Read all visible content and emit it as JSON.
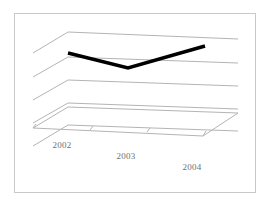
{
  "figure": {
    "background_color": "#ffffff",
    "border_color": "#c9c9c9",
    "gridline_color": "#b4b4b4",
    "floor_color": "#b4b4b4",
    "series_color": "#000000",
    "label_color": "#6f6f6f"
  },
  "chart_data": {
    "type": "line",
    "title": "",
    "subtitle": "",
    "xlabel": "",
    "ylabel": "",
    "categories": [
      "2002",
      "2003",
      "2004"
    ],
    "series": [
      {
        "name": "",
        "values": [
          2.0,
          1.4,
          2.35
        ]
      }
    ],
    "x": [
      "2002",
      "2003",
      "2004"
    ],
    "ylim": [
      0,
      4
    ],
    "yticks": [
      0,
      1,
      2,
      3,
      4
    ],
    "ytick_labels": [
      "",
      "",
      "",
      "",
      ""
    ],
    "grid": true,
    "legend": false,
    "legend_position": "none",
    "projection": "3d",
    "annotations": []
  },
  "axis": {
    "x_tick_labels": [
      {
        "text": "2002",
        "x": 62,
        "y": 148
      },
      {
        "text": "2003",
        "x": 126,
        "y": 159
      },
      {
        "text": "2004",
        "x": 192,
        "y": 170
      }
    ]
  },
  "geometry": {
    "border": {
      "x": 14.5,
      "y": 13.5,
      "width": 241,
      "height": 179
    },
    "gridlines": [
      {
        "name": "gridline-top",
        "left_x": 33,
        "left_y": 53,
        "bend_x": 68,
        "bend_y": 32,
        "right_x": 238,
        "right_y": 39
      },
      {
        "name": "gridline-2",
        "left_x": 33,
        "left_y": 77,
        "bend_x": 68,
        "bend_y": 57,
        "right_x": 238,
        "right_y": 63
      },
      {
        "name": "gridline-3",
        "left_x": 33,
        "left_y": 100,
        "bend_x": 68,
        "bend_y": 80,
        "right_x": 238,
        "right_y": 86
      },
      {
        "name": "gridline-4",
        "left_x": 33,
        "left_y": 123,
        "bend_x": 68,
        "bend_y": 103,
        "right_x": 238,
        "right_y": 109
      },
      {
        "name": "gridline-base",
        "left_x": 33,
        "left_y": 146,
        "bend_x": 68,
        "bend_y": 125,
        "right_x": 238,
        "right_y": 131
      }
    ],
    "floor": {
      "front_left_x": 33,
      "front_left_y": 128,
      "back_left_x": 68,
      "back_left_y": 107,
      "back_right_x": 238,
      "back_right_y": 113,
      "front_right_x": 203,
      "front_right_y": 136
    },
    "floor_ticks": [
      {
        "x1": 33,
        "y1": 128,
        "x2": 36,
        "y2": 124
      },
      {
        "x1": 90,
        "y1": 130,
        "x2": 93,
        "y2": 126
      },
      {
        "x1": 147,
        "y1": 132,
        "x2": 150,
        "y2": 128
      },
      {
        "x1": 203,
        "y1": 136,
        "x2": 206,
        "y2": 131
      }
    ],
    "series_points": [
      {
        "label": "2002",
        "x": 68,
        "y": 53
      },
      {
        "label": "2003",
        "x": 128,
        "y": 68
      },
      {
        "label": "2004",
        "x": 205,
        "y": 46
      }
    ],
    "series_width": 3.6
  }
}
